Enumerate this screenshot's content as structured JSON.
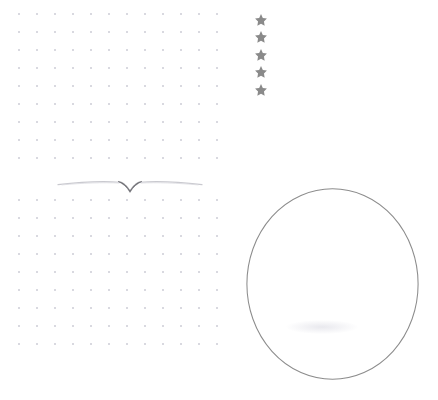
{
  "page": {
    "background_color": "#ffffff",
    "width": 438,
    "height": 400
  },
  "dot_grids": [
    {
      "name": "top-dot-grid",
      "label": "Top dot grid panel",
      "dot_color": "#d9d9e0",
      "dot_spacing_px": 18,
      "dot_radius_px": 1,
      "columns": 12,
      "rows": 9
    },
    {
      "name": "bottom-dot-grid",
      "label": "Bottom dot grid panel",
      "dot_color": "#d9d9e0",
      "dot_spacing_px": 18,
      "dot_radius_px": 1,
      "columns": 12,
      "rows": 9
    }
  ],
  "divider": {
    "name": "chevron-divider-ornament",
    "label": "Decorative divider",
    "style": "thin rule with centre downward chevron",
    "line_color": "#c9c9cf",
    "chevron_color": "#6d6d73",
    "width_px": 148
  },
  "rating": {
    "label": "Star rating",
    "icon_name": "star-icon",
    "count": 5,
    "filled": 5,
    "star_color": "#8a8a8a",
    "orientation": "vertical",
    "stars": [
      {
        "index": 1,
        "state": "filled"
      },
      {
        "index": 2,
        "state": "filled"
      },
      {
        "index": 3,
        "state": "filled"
      },
      {
        "index": 4,
        "state": "filled"
      },
      {
        "index": 5,
        "state": "filled"
      }
    ]
  },
  "circle": {
    "name": "circle-outline",
    "label": "Circle outline",
    "stroke_color": "#8c8c8c",
    "stroke_width_px": 1,
    "fill": "none",
    "width_px": 173,
    "height_px": 192
  },
  "colors": {
    "background": "#ffffff",
    "dot": "#d9d9e0",
    "star": "#8a8a8a",
    "circle_stroke": "#8c8c8c",
    "divider_line": "#c9c9cf",
    "divider_chevron": "#6d6d73"
  }
}
